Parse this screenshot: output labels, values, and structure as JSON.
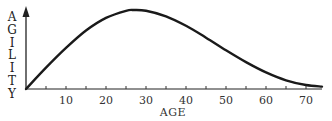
{
  "chart_data": {
    "type": "line",
    "title": "",
    "xlabel": "AGE",
    "ylabel": "AGILITY",
    "ylabel_letters": [
      "A",
      "G",
      "I",
      "L",
      "I",
      "T",
      "Y"
    ],
    "x_ticks": [
      10,
      20,
      30,
      40,
      50,
      60,
      70
    ],
    "x_minor_ticks": [
      5,
      15,
      25,
      35,
      45,
      55,
      65
    ],
    "xlim": [
      0,
      74
    ],
    "ylim": [
      0,
      1
    ],
    "y_ticks_shown": false,
    "grid": false,
    "legend": null,
    "series": [
      {
        "name": "Agility",
        "x": [
          0,
          5,
          10,
          15,
          20,
          25,
          27,
          30,
          35,
          40,
          45,
          50,
          55,
          60,
          65,
          70,
          74
        ],
        "y": [
          0.0,
          0.27,
          0.52,
          0.74,
          0.9,
          0.99,
          1.0,
          0.99,
          0.92,
          0.8,
          0.65,
          0.49,
          0.34,
          0.21,
          0.11,
          0.05,
          0.03
        ]
      }
    ]
  },
  "axis_labels": {
    "x": "AGE",
    "y_letters": [
      "A",
      "G",
      "I",
      "L",
      "I",
      "T",
      "Y"
    ],
    "ticks": [
      "10",
      "20",
      "30",
      "40",
      "50",
      "60",
      "70"
    ]
  }
}
